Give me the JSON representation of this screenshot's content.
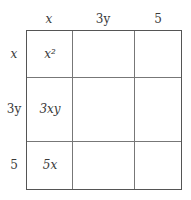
{
  "column_headers": [
    {
      "label": "x",
      "italic": true
    },
    {
      "label": "3y",
      "italic": false
    },
    {
      "label": "5",
      "italic": false
    }
  ],
  "row_headers": [
    {
      "label": "x",
      "italic": true
    },
    {
      "label": "3y",
      "italic": false
    },
    {
      "label": "5",
      "italic": false
    }
  ],
  "cells": [
    [
      "x²",
      "",
      ""
    ],
    [
      "3xy",
      "",
      ""
    ],
    [
      "5x",
      "",
      ""
    ]
  ],
  "colors": {
    "grid_line": "#555555",
    "text": "#3a3a3a"
  }
}
